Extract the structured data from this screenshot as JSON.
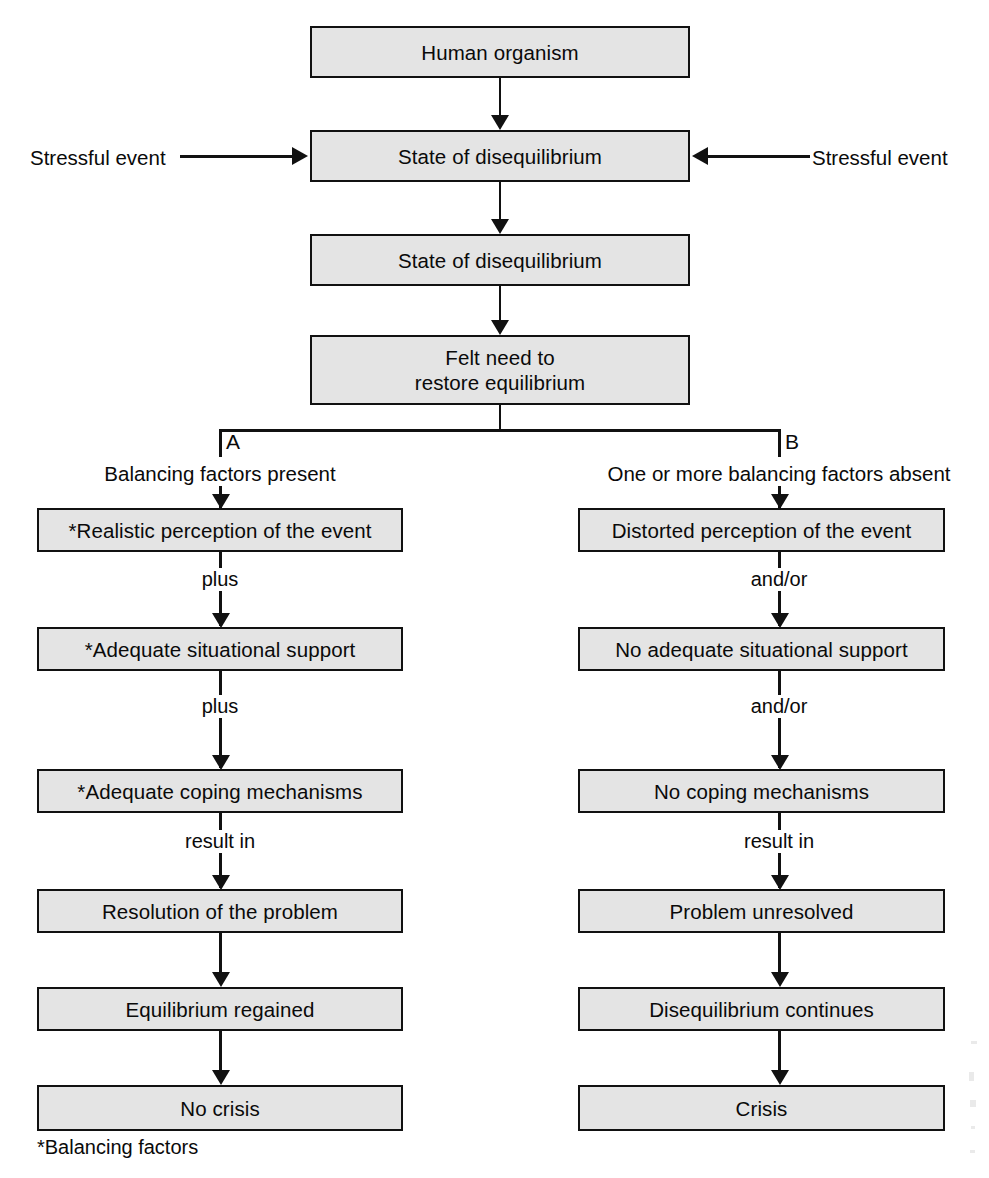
{
  "diagram": {
    "title_text": "",
    "colors": {
      "box_fill": "#e4e4e4",
      "box_border": "#111111",
      "line": "#111111",
      "text": "#0a0a0a",
      "background": "#ffffff"
    },
    "trunk": [
      {
        "id": "human-organism",
        "label": "Human organism"
      },
      {
        "id": "state-of-disequilibrium-1",
        "label": "State of disequilibrium"
      },
      {
        "id": "state-of-disequilibrium-2",
        "label": "State of disequilibrium"
      },
      {
        "id": "felt-need",
        "label": "Felt need to\nrestore equilibrium"
      }
    ],
    "external_inputs": [
      {
        "id": "stressful-event-left",
        "label": "Stressful event",
        "side": "left"
      },
      {
        "id": "stressful-event-right",
        "label": "Stressful event",
        "side": "right"
      }
    ],
    "branches": [
      {
        "letter": "A",
        "heading": "Balancing factors present",
        "nodes": [
          {
            "id": "realistic-perception",
            "label": "*Realistic perception of the event"
          },
          {
            "id": "adequate-situational-support",
            "label": "*Adequate situational support"
          },
          {
            "id": "adequate-coping-mechanisms",
            "label": "*Adequate coping mechanisms"
          },
          {
            "id": "resolution-of-the-problem",
            "label": "Resolution of the problem"
          },
          {
            "id": "equilibrium-regained",
            "label": "Equilibrium regained"
          },
          {
            "id": "no-crisis",
            "label": "No crisis"
          }
        ],
        "connector_labels": [
          "plus",
          "plus",
          "result in",
          "",
          ""
        ]
      },
      {
        "letter": "B",
        "heading": "One or more balancing factors absent",
        "nodes": [
          {
            "id": "distorted-perception",
            "label": "Distorted perception of the event"
          },
          {
            "id": "no-adequate-situational-support",
            "label": "No adequate situational support"
          },
          {
            "id": "no-coping-mechanisms",
            "label": "No coping mechanisms"
          },
          {
            "id": "problem-unresolved",
            "label": "Problem unresolved"
          },
          {
            "id": "disequilibrium-continues",
            "label": "Disequilibrium continues"
          },
          {
            "id": "crisis",
            "label": "Crisis"
          }
        ],
        "connector_labels": [
          "and/or",
          "and/or",
          "result in",
          "",
          ""
        ]
      }
    ],
    "footnote": "*Balancing factors"
  }
}
